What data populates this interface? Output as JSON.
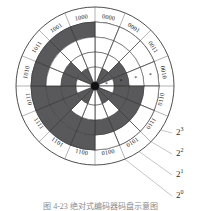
{
  "figure": {
    "kind": "absolute-encoder-disc",
    "caption": "图 4-23 绝对式编码器码盘示意图"
  },
  "disc": {
    "center": {
      "x": 95,
      "y": 86
    },
    "outer_ring_radius": 79,
    "label_ring_radius": 71,
    "track_outer_radius": 64,
    "hub_radius": 4,
    "sector_count": 16,
    "start_angle_deg": -90,
    "track_count": 4,
    "track_radii": [
      64,
      49,
      34,
      19
    ],
    "dark_color": "#59595b",
    "light_color": "#ffffff",
    "line_color": "#3a3a3a",
    "hub_color": "#111111",
    "sector_labels": [
      "0000",
      "0001",
      "0011",
      "0010",
      "0110",
      "0111",
      "0101",
      "0100",
      "1100",
      "1101",
      "1111",
      "1110",
      "1010",
      "1011",
      "1001",
      "1000"
    ],
    "track_bits": [
      {
        "name": "2^3",
        "bit_index": 3,
        "pattern": [
          0,
          0,
          0,
          0,
          0,
          0,
          0,
          0,
          1,
          1,
          1,
          1,
          1,
          1,
          1,
          1
        ]
      },
      {
        "name": "2^2",
        "bit_index": 2,
        "pattern": [
          0,
          0,
          0,
          0,
          1,
          1,
          1,
          1,
          1,
          1,
          1,
          1,
          0,
          0,
          0,
          0
        ]
      },
      {
        "name": "2^1",
        "bit_index": 1,
        "pattern": [
          0,
          0,
          1,
          1,
          1,
          1,
          0,
          0,
          0,
          0,
          1,
          1,
          1,
          1,
          0,
          0
        ]
      },
      {
        "name": "2^0",
        "bit_index": 0,
        "pattern": [
          0,
          1,
          1,
          0,
          0,
          1,
          1,
          0,
          0,
          1,
          1,
          0,
          0,
          1,
          1,
          0
        ]
      }
    ],
    "markers": [
      {
        "track": 0,
        "sector": 3,
        "glyph": "*"
      },
      {
        "track": 1,
        "sector": 3,
        "glyph": "*"
      },
      {
        "track": 2,
        "sector": 3,
        "glyph": "*"
      },
      {
        "track": 3,
        "sector": 3,
        "glyph": "*"
      }
    ]
  },
  "legend": {
    "items": [
      {
        "base": "2",
        "exp": "3",
        "label": "2^3",
        "x": 176,
        "y": 133,
        "line": {
          "x1": 150,
          "y1": 127,
          "x2": 172,
          "y2": 133
        }
      },
      {
        "base": "2",
        "exp": "2",
        "label": "2^2",
        "x": 176,
        "y": 154,
        "line": {
          "x1": 138,
          "y1": 134,
          "x2": 172,
          "y2": 154
        }
      },
      {
        "base": "2",
        "exp": "1",
        "label": "2^1",
        "x": 176,
        "y": 175,
        "line": {
          "x1": 123,
          "y1": 140,
          "x2": 172,
          "y2": 175
        }
      },
      {
        "base": "2",
        "exp": "0",
        "label": "2^0",
        "x": 176,
        "y": 196,
        "line": {
          "x1": 108,
          "y1": 146,
          "x2": 172,
          "y2": 196
        }
      }
    ],
    "leader_color": "#b9b9b9"
  }
}
